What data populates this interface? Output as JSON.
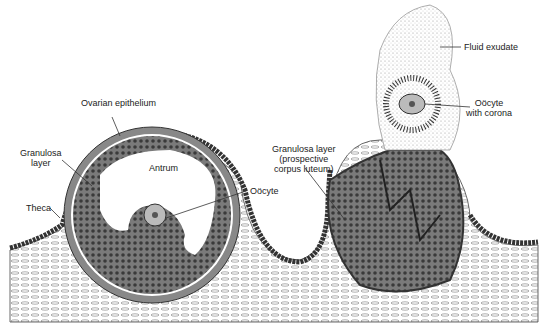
{
  "figure": {
    "type": "anatomical illustration",
    "labels": {
      "ovarian_epithelium": "Ovarian epithelium",
      "granulosa_layer_1": "Granulosa",
      "granulosa_layer_2": "layer",
      "theca": "Theca",
      "antrum": "Antrum",
      "oocyte": "Oöcyte",
      "granulosa_prospective_1": "Granulosa layer",
      "granulosa_prospective_2": "(prospective",
      "granulosa_prospective_3": "corpus luteum)",
      "fluid_exudate": "Fluid exudate",
      "oocyte_corona_1": "Oöcyte",
      "oocyte_corona_2": "with corona"
    },
    "colors": {
      "ink": "#222222",
      "granulosa_fill": "#6a6a6a",
      "stroma": "#9a9a9a",
      "paper": "#ffffff"
    }
  }
}
